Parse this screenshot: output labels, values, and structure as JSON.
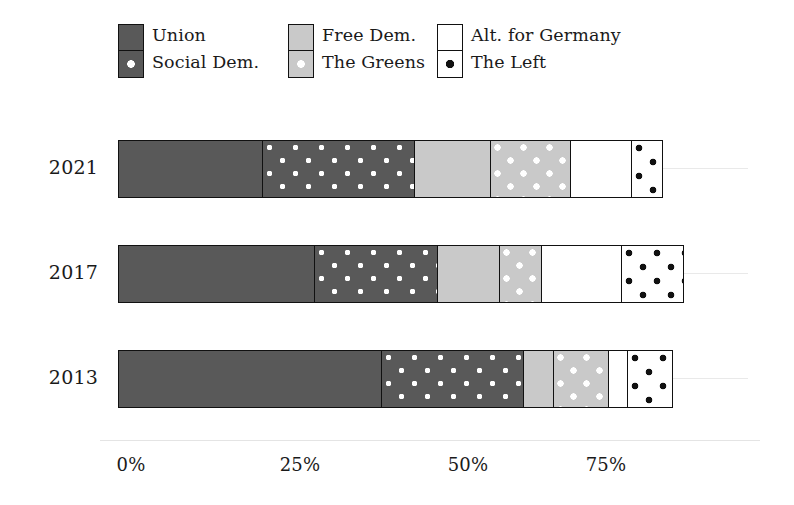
{
  "chart_data": {
    "type": "bar",
    "orientation": "horizontal",
    "stacked": true,
    "title": "",
    "xlabel": "",
    "ylabel": "",
    "categories": [
      "2021",
      "2017",
      "2013"
    ],
    "xlim": [
      0,
      100
    ],
    "xticks": [
      0,
      25,
      50,
      75
    ],
    "xticklabels": [
      "0%",
      "25%",
      "50%",
      "75%"
    ],
    "grid": true,
    "legend_position": "top",
    "series": [
      {
        "name": "Union",
        "key": "union",
        "color": "#595959",
        "pattern": "solid",
        "values": [
          22.8,
          31.0,
          41.5
        ]
      },
      {
        "name": "Social Dem.",
        "key": "spd",
        "color": "#595959",
        "pattern": "white-dots",
        "values": [
          24.0,
          19.4,
          22.5
        ]
      },
      {
        "name": "Free Dem.",
        "key": "fdp",
        "color": "#c9c9c9",
        "pattern": "solid",
        "values": [
          12.0,
          9.8,
          4.7
        ]
      },
      {
        "name": "The Greens",
        "key": "greens",
        "color": "#c9c9c9",
        "pattern": "white-dots",
        "values": [
          12.6,
          6.6,
          8.6
        ]
      },
      {
        "name": "Alt. for Germany",
        "key": "afd",
        "color": "#ffffff",
        "pattern": "solid",
        "values": [
          9.6,
          12.6,
          3.0
        ]
      },
      {
        "name": "The Left",
        "key": "left",
        "color": "#ffffff",
        "pattern": "black-dots",
        "values": [
          4.7,
          9.6,
          7.0
        ]
      }
    ],
    "totals": [
      85.7,
      89.0,
      87.3
    ]
  },
  "legend": {
    "columns": [
      {
        "top_label": "Union",
        "bottom_label": "Social Dem."
      },
      {
        "top_label": "Free Dem.",
        "bottom_label": "The Greens"
      },
      {
        "top_label": "Alt. for Germany",
        "bottom_label": "The Left"
      }
    ]
  },
  "axis": {
    "ticklabels": [
      "0%",
      "25%",
      "50%",
      "75%"
    ]
  },
  "years": [
    "2021",
    "2017",
    "2013"
  ]
}
